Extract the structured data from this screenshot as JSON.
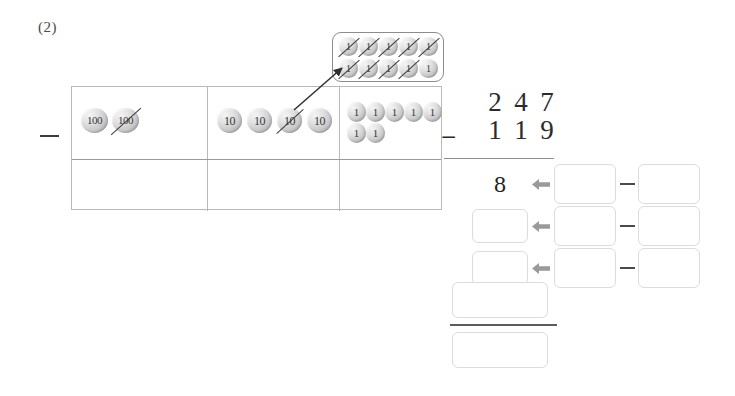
{
  "problem": {
    "label": "(2)",
    "minuend": "247",
    "subtrahend": "119",
    "operator": "−"
  },
  "algorithm": {
    "minuend_digits": [
      "2",
      "4",
      "7"
    ],
    "subtrahend_digits": [
      "1",
      "1",
      "9"
    ],
    "operator": "−"
  },
  "place_value_table": {
    "columns": [
      {
        "name": "hundreds",
        "counter_label": "100",
        "counters": [
          {
            "label": "100",
            "crossed": false
          },
          {
            "label": "100",
            "crossed": true
          }
        ],
        "answer_cell": ""
      },
      {
        "name": "tens",
        "counter_label": "10",
        "counters": [
          {
            "label": "10",
            "crossed": false
          },
          {
            "label": "10",
            "crossed": false
          },
          {
            "label": "10",
            "crossed": true
          },
          {
            "label": "10",
            "crossed": false
          }
        ],
        "answer_cell": ""
      },
      {
        "name": "ones",
        "counter_label": "1",
        "counters": [
          {
            "label": "1",
            "crossed": false
          },
          {
            "label": "1",
            "crossed": false
          },
          {
            "label": "1",
            "crossed": false
          },
          {
            "label": "1",
            "crossed": false
          },
          {
            "label": "1",
            "crossed": false
          },
          {
            "label": "1",
            "crossed": false
          },
          {
            "label": "1",
            "crossed": false
          }
        ],
        "answer_cell": ""
      }
    ],
    "left_operator": "−"
  },
  "regroup_box": {
    "description": "ten ones traded from one ten",
    "counters": [
      {
        "label": "1",
        "crossed": true
      },
      {
        "label": "1",
        "crossed": true
      },
      {
        "label": "1",
        "crossed": true
      },
      {
        "label": "1",
        "crossed": true
      },
      {
        "label": "1",
        "crossed": true
      },
      {
        "label": "1",
        "crossed": true
      },
      {
        "label": "1",
        "crossed": true
      },
      {
        "label": "1",
        "crossed": true
      },
      {
        "label": "1",
        "crossed": true
      },
      {
        "label": "1",
        "crossed": false
      }
    ]
  },
  "work_rows": [
    {
      "result": "8",
      "left_operand": "",
      "operator": "−",
      "right_operand": ""
    },
    {
      "result": "",
      "left_operand": "",
      "operator": "−",
      "right_operand": ""
    },
    {
      "result": "",
      "left_operand": "",
      "operator": "−",
      "right_operand": ""
    }
  ],
  "final_boxes": [
    {
      "value": ""
    },
    {
      "value": ""
    }
  ],
  "colors": {
    "counter_fill": "#c9c9c9",
    "box_border": "#dcdcdc",
    "table_border": "#b9b9b9",
    "ink": "#2b2b2b",
    "arrow": "#8a8a8a",
    "page_background": "#ffffff"
  }
}
